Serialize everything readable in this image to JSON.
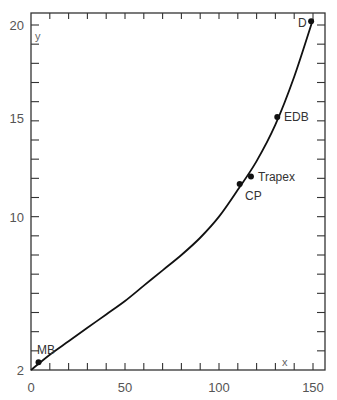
{
  "chart_data": {
    "type": "line",
    "title": "",
    "xlabel": "x",
    "ylabel": "y",
    "xlim": [
      0,
      155
    ],
    "ylim": [
      2,
      20.6
    ],
    "x_ticks": [
      0,
      50,
      100,
      150
    ],
    "y_ticks": [
      2,
      10,
      15,
      20
    ],
    "x_minor_step": 10,
    "y_minor_step": 1,
    "grid": false,
    "curve": {
      "x": [
        0,
        10,
        20,
        30,
        40,
        50,
        60,
        70,
        80,
        90,
        100,
        110,
        120,
        130,
        140,
        150
      ],
      "y": [
        2.0,
        2.8,
        3.5,
        4.2,
        4.9,
        5.6,
        6.4,
        7.2,
        8.0,
        8.9,
        10.0,
        11.4,
        12.9,
        14.8,
        17.3,
        20.3
      ]
    },
    "points": [
      {
        "label": "MB",
        "x": 4,
        "y": 2.4
      },
      {
        "label": "CP",
        "x": 111,
        "y": 11.7
      },
      {
        "label": "Trapex",
        "x": 117,
        "y": 12.1
      },
      {
        "label": "EDB",
        "x": 131,
        "y": 15.2
      },
      {
        "label": "D",
        "x": 149,
        "y": 20.2
      }
    ]
  },
  "labels": {
    "x_axis": "x",
    "y_axis": "y",
    "tick_x": [
      "0",
      "50",
      "100",
      "150"
    ],
    "tick_y": [
      "2",
      "10",
      "15",
      "20"
    ],
    "points": [
      "MB",
      "CP",
      "Trapex",
      "EDB",
      "D"
    ]
  }
}
